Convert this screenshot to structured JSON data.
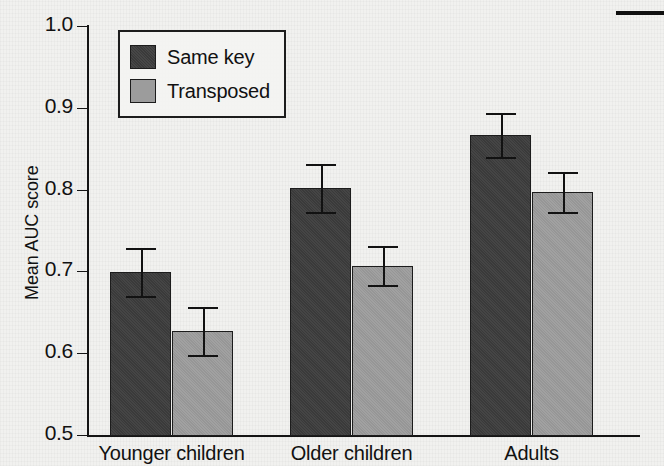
{
  "chart_data": {
    "type": "bar",
    "title": "",
    "xlabel": "",
    "ylabel": "Mean AUC score",
    "ylim": [
      0.5,
      1.0
    ],
    "yticks": [
      "0.5",
      "0.6",
      "0.7",
      "0.8",
      "0.9",
      "1.0"
    ],
    "ytick_values": [
      0.5,
      0.6,
      0.7,
      0.8,
      0.9,
      1.0
    ],
    "grid": false,
    "legend_position": "top-left",
    "categories": [
      "Younger children",
      "Older children",
      "Adults"
    ],
    "series": [
      {
        "name": "Same key",
        "color": "#3d3d3d",
        "values": [
          0.699,
          0.802,
          0.867
        ],
        "errors": [
          0.029,
          0.029,
          0.027
        ]
      },
      {
        "name": "Transposed",
        "color": "#9c9c9c",
        "values": [
          0.627,
          0.707,
          0.797
        ],
        "errors": [
          0.029,
          0.024,
          0.024
        ]
      }
    ]
  },
  "axes": {
    "y_axis_label": "Mean AUC score"
  },
  "legend": {
    "entries": [
      {
        "label": "Same key",
        "swatch": "dark"
      },
      {
        "label": "Transposed",
        "swatch": "light"
      }
    ]
  },
  "artifacts": {
    "top_rule_note": "page-edge rule"
  }
}
